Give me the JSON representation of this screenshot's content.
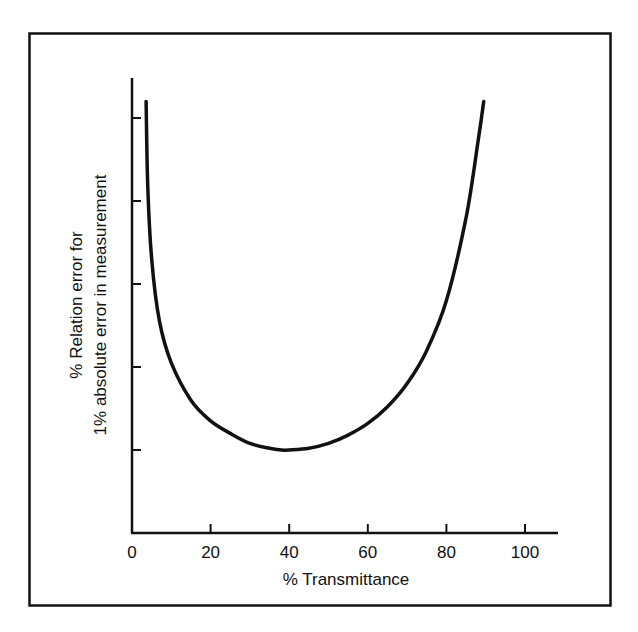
{
  "chart_data": {
    "type": "line",
    "title": "",
    "xlabel": "% Transmittance",
    "ylabel_line1": "% Relation error for",
    "ylabel_line2": "1% absolute error in measurement",
    "xlim": [
      0,
      108
    ],
    "ylim": [
      0,
      5
    ],
    "x_ticks": [
      0,
      20,
      40,
      60,
      80,
      100
    ],
    "x_tick_labels": [
      "0",
      "20",
      "40",
      "60",
      "80",
      "100"
    ],
    "y_ticks": [
      1,
      2,
      3,
      4,
      5
    ],
    "y_tick_labels": [
      "",
      "",
      "",
      "",
      ""
    ],
    "grid": false,
    "legend": null,
    "series": [
      {
        "name": "relative error curve",
        "x": [
          3.6,
          4,
          5,
          7,
          10,
          15,
          20,
          25,
          30,
          35,
          38,
          40,
          45,
          50,
          55,
          60,
          65,
          70,
          75,
          80,
          85,
          88,
          89.5
        ],
        "y": [
          5.2,
          4.2,
          3.3,
          2.55,
          2.05,
          1.6,
          1.35,
          1.2,
          1.08,
          1.02,
          1.0,
          1.0,
          1.02,
          1.08,
          1.18,
          1.32,
          1.52,
          1.8,
          2.2,
          2.8,
          3.8,
          4.7,
          5.2
        ]
      }
    ]
  }
}
